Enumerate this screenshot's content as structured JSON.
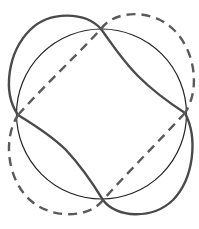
{
  "diagram": {
    "type": "geometric-figure",
    "colors": {
      "background": "#ffffff",
      "circle": "#222222",
      "solid_curve": "#4a4a4a",
      "dashed_curve": "#5a5a5a"
    },
    "circle": {
      "cx": 101.5,
      "cy": 114,
      "r": 85
    },
    "intersection_points": [
      {
        "name": "top",
        "x": 101,
        "y": 29
      },
      {
        "name": "right",
        "x": 185,
        "y": 113
      },
      {
        "name": "bottom",
        "x": 103,
        "y": 200
      },
      {
        "name": "left",
        "x": 18,
        "y": 115
      }
    ],
    "curves": [
      {
        "name": "solid",
        "style": "solid"
      },
      {
        "name": "dashed",
        "style": "dashed"
      }
    ]
  }
}
